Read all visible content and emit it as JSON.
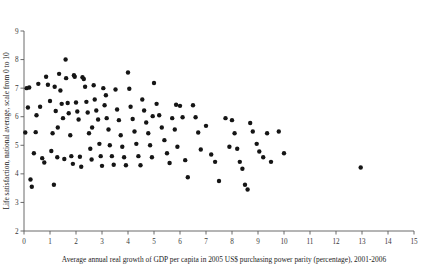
{
  "chart_data": {
    "type": "scatter",
    "title": "",
    "xlabel": "Average annual real growth of GDP per capita in 2005 US$ purchasing power parity (percentage), 2001-2006",
    "ylabel": "Life satisfaction, national average, scale from 0 to 10",
    "xlim": [
      0,
      15
    ],
    "ylim": [
      2,
      9
    ],
    "xticks": [
      0,
      1,
      2,
      3,
      4,
      5,
      6,
      7,
      8,
      9,
      10,
      11,
      12,
      13,
      14,
      15
    ],
    "yticks": [
      2,
      3,
      4,
      5,
      6,
      7,
      8,
      9
    ],
    "xtick_labels": [
      "0",
      "1",
      "2",
      "3",
      "4",
      "5",
      "6",
      "7",
      "8",
      "9",
      "10",
      "11",
      "12",
      "13",
      "14",
      "15"
    ],
    "ytick_labels": [
      "2",
      "3",
      "4",
      "5",
      "6",
      "7",
      "8",
      "9"
    ],
    "grid": false,
    "legend": null,
    "marker": "circle",
    "marker_color": "#151515",
    "marker_size": 2.2,
    "n_points": 130,
    "points": [
      [
        0.05,
        5.45
      ],
      [
        0.1,
        7.0
      ],
      [
        0.15,
        6.32
      ],
      [
        0.2,
        7.02
      ],
      [
        0.25,
        3.8
      ],
      [
        0.3,
        3.55
      ],
      [
        0.38,
        4.72
      ],
      [
        0.45,
        5.46
      ],
      [
        0.55,
        7.15
      ],
      [
        0.62,
        6.35
      ],
      [
        0.7,
        4.55
      ],
      [
        0.78,
        4.4
      ],
      [
        0.85,
        7.4
      ],
      [
        0.92,
        7.12
      ],
      [
        1.0,
        6.55
      ],
      [
        1.05,
        4.8
      ],
      [
        1.1,
        5.42
      ],
      [
        1.18,
        7.05
      ],
      [
        1.22,
        6.2
      ],
      [
        1.28,
        4.58
      ],
      [
        1.35,
        7.5
      ],
      [
        1.4,
        6.92
      ],
      [
        1.45,
        6.45
      ],
      [
        1.5,
        5.95
      ],
      [
        1.55,
        4.52
      ],
      [
        1.6,
        8.0
      ],
      [
        1.62,
        7.35
      ],
      [
        1.68,
        6.48
      ],
      [
        1.72,
        6.12
      ],
      [
        1.78,
        5.35
      ],
      [
        1.82,
        4.62
      ],
      [
        1.88,
        4.35
      ],
      [
        1.92,
        7.45
      ],
      [
        1.95,
        7.4
      ],
      [
        2.0,
        6.5
      ],
      [
        2.05,
        6.18
      ],
      [
        2.1,
        5.9
      ],
      [
        2.15,
        4.6
      ],
      [
        2.2,
        4.25
      ],
      [
        2.25,
        7.38
      ],
      [
        2.3,
        7.32
      ],
      [
        2.35,
        7.05
      ],
      [
        2.4,
        6.52
      ],
      [
        2.45,
        6.15
      ],
      [
        2.5,
        5.42
      ],
      [
        2.55,
        4.88
      ],
      [
        2.6,
        4.5
      ],
      [
        2.68,
        7.1
      ],
      [
        2.72,
        6.6
      ],
      [
        2.78,
        6.22
      ],
      [
        2.85,
        5.9
      ],
      [
        2.9,
        5.05
      ],
      [
        2.95,
        4.62
      ],
      [
        3.0,
        4.28
      ],
      [
        3.05,
        7.0
      ],
      [
        3.1,
        6.4
      ],
      [
        3.18,
        5.95
      ],
      [
        3.25,
        5.55
      ],
      [
        3.3,
        5.0
      ],
      [
        3.38,
        4.62
      ],
      [
        3.45,
        4.32
      ],
      [
        3.52,
        6.95
      ],
      [
        3.58,
        6.25
      ],
      [
        3.65,
        5.88
      ],
      [
        3.72,
        5.35
      ],
      [
        3.78,
        4.95
      ],
      [
        3.85,
        4.58
      ],
      [
        3.92,
        4.3
      ],
      [
        4.0,
        7.55
      ],
      [
        4.05,
        6.98
      ],
      [
        4.1,
        6.35
      ],
      [
        4.18,
        5.92
      ],
      [
        4.25,
        5.48
      ],
      [
        4.32,
        5.05
      ],
      [
        4.4,
        4.62
      ],
      [
        4.48,
        4.3
      ],
      [
        4.55,
        6.6
      ],
      [
        4.62,
        6.22
      ],
      [
        4.7,
        5.8
      ],
      [
        4.78,
        5.42
      ],
      [
        4.85,
        5.0
      ],
      [
        4.92,
        4.58
      ],
      [
        5.0,
        7.18
      ],
      [
        5.1,
        6.45
      ],
      [
        5.2,
        6.05
      ],
      [
        5.3,
        5.62
      ],
      [
        5.4,
        5.18
      ],
      [
        5.5,
        4.72
      ],
      [
        5.6,
        4.38
      ],
      [
        5.7,
        5.95
      ],
      [
        5.8,
        5.55
      ],
      [
        5.9,
        4.95
      ],
      [
        6.0,
        6.38
      ],
      [
        6.1,
        5.98
      ],
      [
        6.2,
        4.48
      ],
      [
        6.3,
        3.88
      ],
      [
        6.5,
        6.4
      ],
      [
        6.6,
        5.98
      ],
      [
        6.7,
        5.45
      ],
      [
        6.8,
        4.85
      ],
      [
        7.0,
        5.68
      ],
      [
        7.2,
        4.68
      ],
      [
        7.35,
        4.42
      ],
      [
        7.5,
        3.75
      ],
      [
        7.75,
        5.95
      ],
      [
        7.9,
        4.95
      ],
      [
        8.0,
        5.88
      ],
      [
        8.1,
        5.42
      ],
      [
        8.2,
        4.88
      ],
      [
        8.3,
        4.42
      ],
      [
        8.4,
        4.18
      ],
      [
        8.5,
        3.62
      ],
      [
        8.6,
        3.45
      ],
      [
        8.7,
        5.78
      ],
      [
        8.8,
        5.48
      ],
      [
        8.95,
        5.05
      ],
      [
        9.05,
        4.78
      ],
      [
        9.2,
        4.58
      ],
      [
        9.35,
        5.42
      ],
      [
        9.5,
        4.42
      ],
      [
        9.8,
        5.48
      ],
      [
        10.0,
        4.72
      ],
      [
        1.3,
        5.62
      ],
      [
        2.62,
        5.62
      ],
      [
        3.15,
        6.75
      ],
      [
        0.48,
        6.05
      ],
      [
        1.15,
        3.62
      ],
      [
        4.95,
        6.02
      ],
      [
        5.85,
        6.42
      ],
      [
        12.95,
        4.22
      ]
    ]
  }
}
